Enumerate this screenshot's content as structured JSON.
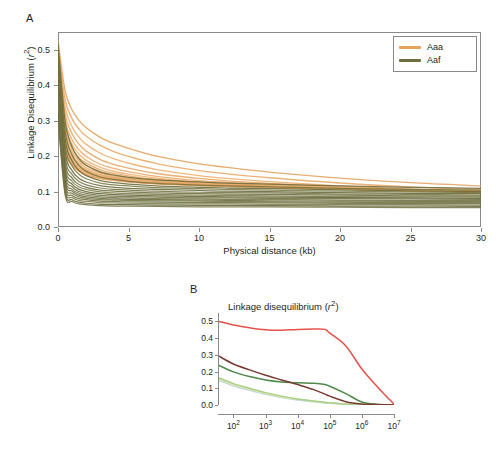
{
  "figure": {
    "background_color": "#ffffff",
    "panels": [
      {
        "letter": "A",
        "name": "panel-a"
      },
      {
        "letter": "B",
        "name": "panel-b"
      }
    ]
  },
  "panel_a": {
    "letter": "A",
    "y_axis_label": "Linkage Disequilibrium (r²)",
    "x_axis_label": "Physical distance (kb)",
    "y_ticks": [
      "0.0",
      "0.1",
      "0.2",
      "0.3",
      "0.4",
      "0.5"
    ],
    "x_ticks": [
      "0",
      "5",
      "10",
      "15",
      "20",
      "25",
      "30"
    ],
    "legend": {
      "items": [
        {
          "label": "Aaa",
          "color": "#e8a45e"
        },
        {
          "label": "Aaf",
          "color": "#6e6e40"
        }
      ]
    }
  },
  "panel_b": {
    "letter": "B",
    "title": "Linkage disequilibrium (r²)",
    "y_ticks": [
      "0.0",
      "0.1",
      "0.2",
      "0.3",
      "0.4",
      "0.5"
    ],
    "x_ticks": [
      "10²",
      "10³",
      "10⁴",
      "10⁵",
      "10⁶",
      "10⁷"
    ],
    "x_tick_bases": [
      "10",
      "10",
      "10",
      "10",
      "10",
      "10"
    ],
    "x_tick_exponents": [
      "2",
      "3",
      "4",
      "5",
      "6",
      "7"
    ]
  },
  "chart_data": [
    {
      "type": "line",
      "name": "panel-a-ld-decay",
      "title": "A",
      "xlabel": "Physical distance (kb)",
      "ylabel": "Linkage Disequilibrium (r²)",
      "xlim": [
        0,
        30
      ],
      "ylim": [
        0.0,
        0.55
      ],
      "grid": false,
      "legend_position": "top-right",
      "x": [
        0,
        0.5,
        1,
        1.5,
        2,
        3,
        4,
        5,
        7,
        10,
        12,
        15,
        20,
        25,
        30
      ],
      "series": [
        {
          "name": "Aaa",
          "group": "Aaa",
          "color": "#e3a05c",
          "values": [
            0.525,
            0.385,
            0.33,
            0.3,
            0.28,
            0.253,
            0.235,
            0.222,
            0.2,
            0.178,
            0.168,
            0.155,
            0.138,
            0.125,
            0.116
          ]
        },
        {
          "name": "Aaa",
          "group": "Aaa",
          "color": "#e9a762",
          "values": [
            0.505,
            0.36,
            0.305,
            0.276,
            0.256,
            0.23,
            0.212,
            0.199,
            0.179,
            0.159,
            0.15,
            0.139,
            0.124,
            0.113,
            0.105
          ]
        },
        {
          "name": "Aaa",
          "group": "Aaa",
          "color": "#eeae6b",
          "values": [
            0.5,
            0.34,
            0.283,
            0.253,
            0.233,
            0.208,
            0.192,
            0.18,
            0.162,
            0.145,
            0.137,
            0.128,
            0.116,
            0.107,
            0.101
          ]
        },
        {
          "name": "Aaa",
          "group": "Aaa",
          "color": "#e7a45f",
          "values": [
            0.495,
            0.322,
            0.263,
            0.233,
            0.214,
            0.19,
            0.176,
            0.166,
            0.151,
            0.137,
            0.13,
            0.123,
            0.113,
            0.106,
            0.101
          ]
        },
        {
          "name": "Aaa",
          "group": "Aaa",
          "color": "#eba765",
          "values": [
            0.49,
            0.305,
            0.246,
            0.217,
            0.199,
            0.177,
            0.165,
            0.156,
            0.143,
            0.131,
            0.126,
            0.12,
            0.111,
            0.105,
            0.1
          ]
        },
        {
          "name": "Aaa",
          "group": "Aaa",
          "color": "#efb070",
          "values": [
            0.487,
            0.292,
            0.233,
            0.205,
            0.188,
            0.168,
            0.157,
            0.149,
            0.138,
            0.127,
            0.123,
            0.117,
            0.11,
            0.104,
            0.1
          ]
        },
        {
          "name": "Aaa",
          "group": "Aaa",
          "color": "#e5a25d",
          "values": [
            0.483,
            0.28,
            0.222,
            0.195,
            0.18,
            0.161,
            0.151,
            0.144,
            0.134,
            0.125,
            0.121,
            0.116,
            0.109,
            0.104,
            0.1
          ]
        },
        {
          "name": "Aaa",
          "group": "Aaa",
          "color": "#eaa968",
          "values": [
            0.48,
            0.27,
            0.213,
            0.187,
            0.173,
            0.156,
            0.147,
            0.14,
            0.131,
            0.123,
            0.119,
            0.115,
            0.108,
            0.104,
            0.1
          ]
        },
        {
          "name": "Aaa",
          "group": "Aaa",
          "color": "#edae6e",
          "values": [
            0.476,
            0.261,
            0.205,
            0.181,
            0.167,
            0.152,
            0.143,
            0.137,
            0.129,
            0.121,
            0.118,
            0.114,
            0.108,
            0.103,
            0.099
          ]
        },
        {
          "name": "Aaa",
          "group": "Aaa",
          "color": "#e6a461",
          "values": [
            0.472,
            0.253,
            0.198,
            0.175,
            0.162,
            0.148,
            0.14,
            0.135,
            0.127,
            0.12,
            0.117,
            0.113,
            0.107,
            0.103,
            0.099
          ]
        },
        {
          "name": "Aaa",
          "group": "Aaa",
          "color": "#eaab6a",
          "values": [
            0.468,
            0.246,
            0.192,
            0.17,
            0.158,
            0.145,
            0.138,
            0.133,
            0.126,
            0.119,
            0.116,
            0.113,
            0.107,
            0.103,
            0.099
          ]
        },
        {
          "name": "Aaa",
          "group": "Aaa",
          "color": "#e8a663",
          "values": [
            0.464,
            0.24,
            0.187,
            0.166,
            0.154,
            0.142,
            0.136,
            0.131,
            0.124,
            0.118,
            0.116,
            0.112,
            0.107,
            0.103,
            0.099
          ]
        },
        {
          "name": "Aaa",
          "group": "Aaa",
          "color": "#eeb173",
          "values": [
            0.46,
            0.234,
            0.182,
            0.162,
            0.151,
            0.14,
            0.134,
            0.13,
            0.123,
            0.118,
            0.115,
            0.112,
            0.107,
            0.103,
            0.099
          ]
        },
        {
          "name": "Aaa",
          "group": "Aaa",
          "color": "#e4a15c",
          "values": [
            0.455,
            0.228,
            0.178,
            0.159,
            0.148,
            0.138,
            0.132,
            0.128,
            0.122,
            0.117,
            0.115,
            0.112,
            0.107,
            0.103,
            0.099
          ]
        },
        {
          "name": "Aaa",
          "group": "Aaa",
          "color": "#eca96a",
          "values": [
            0.45,
            0.222,
            0.174,
            0.156,
            0.146,
            0.136,
            0.131,
            0.127,
            0.122,
            0.117,
            0.114,
            0.111,
            0.106,
            0.102,
            0.098
          ]
        },
        {
          "name": "Aaf",
          "group": "Aaf",
          "color": "#6b6b3c",
          "values": [
            0.52,
            0.3,
            0.226,
            0.192,
            0.174,
            0.155,
            0.146,
            0.14,
            0.133,
            0.127,
            0.124,
            0.121,
            0.116,
            0.112,
            0.109
          ]
        },
        {
          "name": "Aaf",
          "group": "Aaf",
          "color": "#73733f",
          "values": [
            0.5,
            0.272,
            0.203,
            0.173,
            0.157,
            0.141,
            0.134,
            0.129,
            0.123,
            0.118,
            0.116,
            0.113,
            0.109,
            0.106,
            0.104
          ]
        },
        {
          "name": "Aaf",
          "group": "Aaf",
          "color": "#6a6a3a",
          "values": [
            0.488,
            0.25,
            0.186,
            0.159,
            0.145,
            0.131,
            0.125,
            0.121,
            0.116,
            0.112,
            0.11,
            0.108,
            0.105,
            0.102,
            0.1
          ]
        },
        {
          "name": "Aaf",
          "group": "Aaf",
          "color": "#7a7a46",
          "values": [
            0.475,
            0.232,
            0.172,
            0.148,
            0.136,
            0.124,
            0.119,
            0.116,
            0.111,
            0.108,
            0.106,
            0.104,
            0.101,
            0.099,
            0.097
          ]
        },
        {
          "name": "Aaf",
          "group": "Aaf",
          "color": "#666638",
          "values": [
            0.462,
            0.215,
            0.159,
            0.137,
            0.127,
            0.117,
            0.112,
            0.109,
            0.106,
            0.103,
            0.101,
            0.1,
            0.097,
            0.095,
            0.094
          ]
        },
        {
          "name": "Aaf",
          "group": "Aaf",
          "color": "#747443",
          "values": [
            0.45,
            0.2,
            0.148,
            0.128,
            0.119,
            0.11,
            0.106,
            0.104,
            0.101,
            0.098,
            0.097,
            0.096,
            0.093,
            0.092,
            0.09
          ]
        },
        {
          "name": "Aaf",
          "group": "Aaf",
          "color": "#6d6d3e",
          "values": [
            0.438,
            0.186,
            0.138,
            0.12,
            0.112,
            0.104,
            0.101,
            0.099,
            0.096,
            0.094,
            0.093,
            0.092,
            0.09,
            0.088,
            0.087
          ]
        },
        {
          "name": "Aaf",
          "group": "Aaf",
          "color": "#7b7b48",
          "values": [
            0.425,
            0.174,
            0.129,
            0.113,
            0.106,
            0.099,
            0.096,
            0.094,
            0.092,
            0.09,
            0.089,
            0.088,
            0.086,
            0.085,
            0.084
          ]
        },
        {
          "name": "Aaf",
          "group": "Aaf",
          "color": "#636335",
          "values": [
            0.412,
            0.162,
            0.121,
            0.106,
            0.1,
            0.094,
            0.091,
            0.09,
            0.088,
            0.086,
            0.085,
            0.084,
            0.083,
            0.082,
            0.081
          ]
        },
        {
          "name": "Aaf",
          "group": "Aaf",
          "color": "#717141",
          "values": [
            0.4,
            0.152,
            0.114,
            0.1,
            0.095,
            0.089,
            0.087,
            0.086,
            0.084,
            0.082,
            0.082,
            0.081,
            0.08,
            0.079,
            0.078
          ]
        },
        {
          "name": "Aaf",
          "group": "Aaf",
          "color": "#78784a",
          "values": [
            0.388,
            0.142,
            0.107,
            0.095,
            0.09,
            0.085,
            0.083,
            0.082,
            0.08,
            0.079,
            0.078,
            0.078,
            0.076,
            0.075,
            0.075
          ]
        },
        {
          "name": "Aaf",
          "group": "Aaf",
          "color": "#6a6a3d",
          "values": [
            0.375,
            0.133,
            0.101,
            0.09,
            0.085,
            0.081,
            0.079,
            0.078,
            0.077,
            0.076,
            0.075,
            0.074,
            0.073,
            0.072,
            0.072
          ]
        },
        {
          "name": "Aaf",
          "group": "Aaf",
          "color": "#747447",
          "values": [
            0.362,
            0.124,
            0.095,
            0.085,
            0.081,
            0.077,
            0.076,
            0.075,
            0.074,
            0.073,
            0.072,
            0.071,
            0.07,
            0.069,
            0.069
          ]
        },
        {
          "name": "Aaf",
          "group": "Aaf",
          "color": "#6f6f40",
          "values": [
            0.35,
            0.116,
            0.089,
            0.08,
            0.077,
            0.073,
            0.072,
            0.071,
            0.07,
            0.069,
            0.069,
            0.068,
            0.067,
            0.066,
            0.066
          ]
        },
        {
          "name": "Aaf",
          "group": "Aaf",
          "color": "#7c7c4c",
          "values": [
            0.335,
            0.108,
            0.083,
            0.075,
            0.072,
            0.069,
            0.068,
            0.067,
            0.066,
            0.065,
            0.065,
            0.064,
            0.063,
            0.063,
            0.062
          ]
        },
        {
          "name": "Aaf",
          "group": "Aaf",
          "color": "#65653a",
          "values": [
            0.32,
            0.1,
            0.077,
            0.07,
            0.067,
            0.064,
            0.063,
            0.063,
            0.062,
            0.061,
            0.061,
            0.06,
            0.059,
            0.059,
            0.058
          ]
        },
        {
          "name": "Aaf",
          "group": "Aaf",
          "color": "#737344",
          "values": [
            0.305,
            0.092,
            0.072,
            0.065,
            0.063,
            0.06,
            0.059,
            0.059,
            0.058,
            0.057,
            0.057,
            0.057,
            0.056,
            0.055,
            0.055
          ]
        }
      ]
    },
    {
      "type": "line",
      "name": "panel-b-ld-decay-log",
      "title": "Linkage disequilibrium (r²)",
      "xlabel": "",
      "ylabel": "",
      "x_scale": "log10",
      "xlim": [
        1.55,
        7.0
      ],
      "ylim": [
        0.0,
        0.55
      ],
      "grid": false,
      "x_log10": [
        1.55,
        2.0,
        2.5,
        3.0,
        3.5,
        4.0,
        4.5,
        4.85,
        5.0,
        5.5,
        6.0,
        6.5,
        7.0
      ],
      "series": [
        {
          "name": "red-curve",
          "color": "#e8514a",
          "values": [
            0.5,
            0.478,
            0.462,
            0.45,
            0.447,
            0.452,
            0.454,
            0.452,
            0.43,
            0.353,
            0.215,
            0.105,
            0.005
          ]
        },
        {
          "name": "dark-maroon-curve",
          "color": "#7a3b32",
          "values": [
            0.292,
            0.245,
            0.21,
            0.178,
            0.15,
            0.122,
            0.092,
            0.065,
            0.053,
            0.02,
            0.006,
            0.002,
            0.001
          ]
        },
        {
          "name": "medium-green-curve",
          "color": "#4e8a4a",
          "values": [
            0.237,
            0.198,
            0.17,
            0.15,
            0.138,
            0.133,
            0.13,
            0.122,
            0.112,
            0.068,
            0.018,
            0.004,
            0.001
          ]
        },
        {
          "name": "light-green-curve",
          "color": "#a8d08a",
          "values": [
            0.162,
            0.128,
            0.1,
            0.074,
            0.053,
            0.036,
            0.024,
            0.016,
            0.013,
            0.005,
            0.002,
            0.001,
            0.0
          ]
        },
        {
          "name": "pale-yellow-curve",
          "color": "#e4e8a8",
          "values": [
            0.155,
            0.122,
            0.095,
            0.07,
            0.05,
            0.034,
            0.022,
            0.015,
            0.012,
            0.005,
            0.002,
            0.001,
            0.0
          ]
        },
        {
          "name": "pale-blue-curve",
          "color": "#bcd4e0",
          "values": [
            0.148,
            0.115,
            0.088,
            0.064,
            0.045,
            0.03,
            0.019,
            0.012,
            0.01,
            0.004,
            0.001,
            0.001,
            0.0
          ]
        }
      ]
    }
  ]
}
